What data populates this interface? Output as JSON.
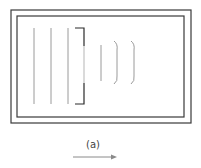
{
  "diagram": {
    "caption": "(a)",
    "colors": {
      "frame": "#3a3a3a",
      "wavefront": "#9a9a9a",
      "barrier": "#2a2a2a",
      "arrow": "#8a8a8a"
    },
    "frames": [
      {
        "name": "outer",
        "x": 11,
        "y": 10,
        "w": 180,
        "h": 113
      },
      {
        "name": "inner",
        "x": 17,
        "y": 16,
        "w": 167,
        "h": 101
      }
    ],
    "incident_wavefronts_x": [
      34,
      51,
      68
    ],
    "incident_wavefront_y": [
      28,
      104
    ],
    "barrier": {
      "x": 84,
      "top_y": 28,
      "bottom_y": 104,
      "lip_x": 75,
      "aperture_y": [
        46,
        83
      ]
    },
    "diffracted_wavefronts": [
      {
        "type": "straight",
        "x": 101,
        "y1": 45,
        "y2": 81
      },
      {
        "type": "arc",
        "x": 114,
        "bulge": 117,
        "y1": 41,
        "y2": 84
      },
      {
        "type": "arc",
        "x": 131,
        "bulge": 134,
        "y1": 41,
        "y2": 84
      }
    ],
    "direction_arrow": {
      "x1": 73,
      "x2": 117,
      "y": 157,
      "direction": "right"
    }
  }
}
